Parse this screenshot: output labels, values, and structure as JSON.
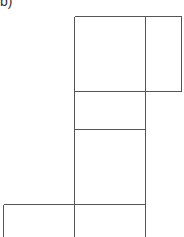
{
  "figure": {
    "label": "b)",
    "line_color": "#555555"
  }
}
